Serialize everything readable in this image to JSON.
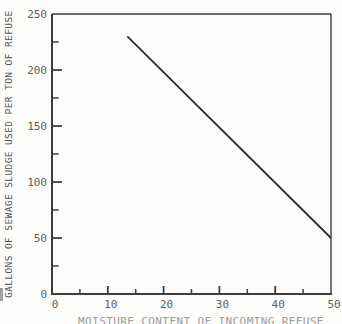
{
  "chart_data": {
    "type": "line",
    "title": "",
    "xlabel": "MOISTURE CONTENT OF INCOMING REFUSE",
    "ylabel": "GALLONS OF SEWAGE SLUDGE USED PER TON OF REFUSE",
    "xlim": [
      0,
      50
    ],
    "ylim": [
      0,
      250
    ],
    "x_ticks_major": [
      0,
      10,
      20,
      30,
      40,
      50
    ],
    "x_ticks_minor": [
      5,
      15,
      25,
      35,
      45
    ],
    "y_ticks_major": [
      0,
      50,
      100,
      150,
      200,
      250
    ],
    "y_ticks_minor": [
      25,
      75,
      125,
      175,
      225
    ],
    "grid": false,
    "legend": "none",
    "series": [
      {
        "name": "sewage-sludge-usage",
        "points": [
          [
            13.5,
            230
          ],
          [
            50,
            50
          ]
        ]
      }
    ],
    "colors": {
      "axis": "#3c3c3c",
      "data_line": "#2e2e2e",
      "tick_label": "#5f5f5f",
      "axis_title": "#4f4f4f",
      "caption": "#9b9b9b",
      "background": "#fcfcfb"
    }
  }
}
